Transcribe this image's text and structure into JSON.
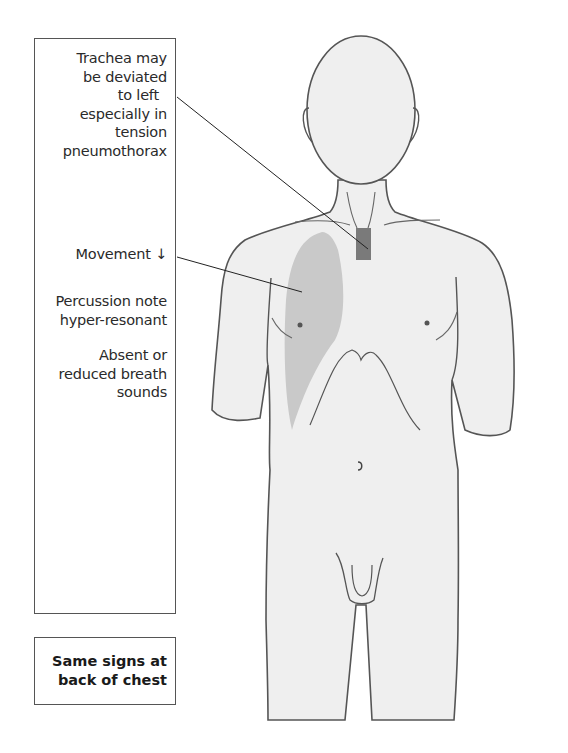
{
  "labels": {
    "trachea": [
      "Trachea may",
      "be deviated",
      "to left",
      "especially in",
      "tension",
      "pneumothorax"
    ],
    "movement": "Movement ↓",
    "percussion": [
      "Percussion note",
      "hyper-resonant"
    ],
    "breath_sounds": [
      "Absent or",
      "reduced breath",
      "sounds"
    ]
  },
  "note": [
    "Same signs at",
    "back of chest"
  ],
  "colors": {
    "skin": "#efefef",
    "outline": "#555555",
    "lung_shading": "#c9c9c9",
    "trachea": "#7a7a7a",
    "leader_line": "#222222"
  }
}
